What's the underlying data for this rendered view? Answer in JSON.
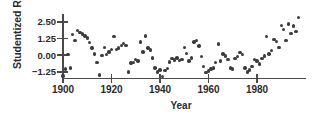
{
  "chart_data": {
    "type": "scatter",
    "title": "",
    "xlabel": "Year",
    "ylabel": "Studentized Residuals",
    "xlim": [
      1898,
      1998
    ],
    "ylim": [
      -2.0,
      3.1
    ],
    "xticks": [
      1900,
      1920,
      1940,
      1960,
      1980
    ],
    "xtick_labels": [
      "1900",
      "1920",
      "1940",
      "1960",
      "1980"
    ],
    "yticks": [
      2.5,
      1.25,
      0.0,
      -1.25
    ],
    "ytick_labels": [
      "2.50",
      "1.25",
      "0.00",
      "−1.25"
    ],
    "grid": false,
    "legend": null,
    "marker_color": "#3c3c3c",
    "axis_color": "#4a4a4a",
    "series": [
      {
        "name": "Studentized residuals",
        "x": [
          1900,
          1901,
          1902,
          1903,
          1904,
          1905,
          1906,
          1907,
          1908,
          1909,
          1910,
          1911,
          1912,
          1913,
          1914,
          1915,
          1916,
          1917,
          1918,
          1919,
          1920,
          1921,
          1922,
          1923,
          1924,
          1925,
          1926,
          1927,
          1928,
          1929,
          1930,
          1931,
          1932,
          1933,
          1934,
          1935,
          1936,
          1937,
          1938,
          1939,
          1940,
          1941,
          1942,
          1943,
          1944,
          1945,
          1946,
          1947,
          1948,
          1949,
          1950,
          1951,
          1952,
          1953,
          1954,
          1955,
          1956,
          1957,
          1958,
          1959,
          1960,
          1961,
          1962,
          1963,
          1964,
          1965,
          1966,
          1967,
          1968,
          1969,
          1970,
          1971,
          1972,
          1973,
          1974,
          1975,
          1976,
          1977,
          1978,
          1979,
          1980,
          1981,
          1982,
          1983,
          1984,
          1985,
          1986,
          1987,
          1988,
          1989,
          1990,
          1991,
          1992,
          1993,
          1994,
          1995,
          1996,
          1997
        ],
        "y": [
          -1.55,
          -1.05,
          0.05,
          -0.95,
          1.55,
          1.1,
          1.85,
          1.7,
          1.6,
          1.45,
          1.3,
          0.95,
          0.55,
          0.1,
          -0.55,
          -1.5,
          0.0,
          0.6,
          0.05,
          0.25,
          0.45,
          1.4,
          0.45,
          0.55,
          0.75,
          0.9,
          0.75,
          -1.25,
          -0.6,
          -0.55,
          -0.3,
          -0.45,
          1.0,
          0.25,
          1.45,
          0.55,
          0.4,
          -0.2,
          -0.95,
          -1.25,
          -1.1,
          -1.6,
          -1.15,
          -1.0,
          -0.5,
          -0.25,
          -0.35,
          -0.2,
          -0.4,
          -0.3,
          0.6,
          0.15,
          -0.45,
          -0.2,
          1.0,
          1.1,
          0.7,
          -0.1,
          -0.85,
          -1.3,
          -1.2,
          -1.05,
          -0.95,
          -0.55,
          0.85,
          -0.45,
          0.1,
          -0.05,
          -0.3,
          -0.95,
          -1.05,
          -0.25,
          -0.1,
          0.2,
          0.05,
          -0.95,
          -1.25,
          -1.1,
          -0.85,
          -0.3,
          -0.45,
          -0.65,
          -0.25,
          -0.05,
          1.4,
          0.1,
          0.35,
          1.2,
          1.05,
          0.6,
          2.25,
          1.95,
          1.1,
          2.35,
          1.65,
          2.2,
          1.8,
          2.85
        ]
      }
    ]
  }
}
